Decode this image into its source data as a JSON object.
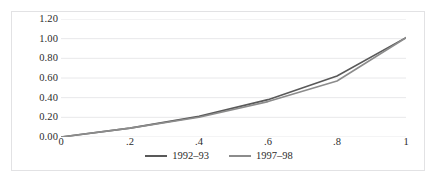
{
  "chart_data": {
    "type": "line",
    "title": "",
    "xlabel": "",
    "ylabel": "",
    "xlim": [
      0,
      1
    ],
    "ylim": [
      0,
      1.2
    ],
    "x": [
      0,
      0.2,
      0.4,
      0.6,
      0.8,
      1
    ],
    "x_tick_labels": [
      "0",
      ".2",
      ".4",
      ".6",
      ".8",
      "1"
    ],
    "y_ticks": [
      0,
      0.2,
      0.4,
      0.6,
      0.8,
      1.0,
      1.2
    ],
    "y_tick_labels": [
      "0.00",
      "0.20",
      "0.40",
      "0.60",
      "0.80",
      "1.00",
      "1.20"
    ],
    "grid": "horizontal",
    "legend_position": "bottom-center",
    "series": [
      {
        "name": "1992–93",
        "color": "#595959",
        "values": [
          0.0,
          0.09,
          0.21,
          0.38,
          0.62,
          1.01
        ]
      },
      {
        "name": "1997–98",
        "color": "#8c8c8c",
        "values": [
          0.0,
          0.09,
          0.2,
          0.36,
          0.57,
          1.01
        ]
      }
    ]
  },
  "style": {
    "grid_color": "#e8e8ea",
    "border_color": "#e2e2e4",
    "text_color": "#2b2b2b",
    "background": "#ffffff"
  }
}
